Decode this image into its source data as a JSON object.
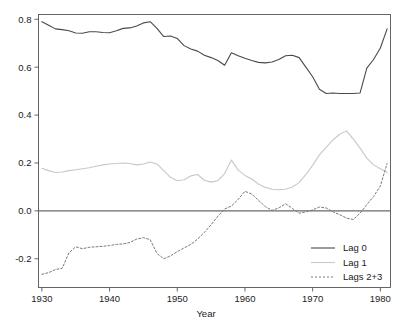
{
  "chart_data": {
    "type": "line",
    "title": "",
    "xlabel": "Year",
    "ylabel": "",
    "xlim": [
      1929.5,
      1981.5
    ],
    "ylim": [
      -0.32,
      0.82
    ],
    "grid": false,
    "legend_position": "bottom-right",
    "x_ticks": [
      1930,
      1940,
      1950,
      1960,
      1970,
      1980
    ],
    "x_tick_labels": [
      "1930",
      "1940",
      "1950",
      "1960",
      "1970",
      "1980"
    ],
    "y_ticks": [
      -0.2,
      0.0,
      0.2,
      0.4,
      0.6,
      0.8
    ],
    "y_tick_labels": [
      "-0.2",
      "0.0",
      "0.2",
      "0.4",
      "0.6",
      "0.8"
    ],
    "zero_reference_line": 0.0,
    "x": [
      1930,
      1931,
      1932,
      1933,
      1934,
      1935,
      1936,
      1937,
      1938,
      1939,
      1940,
      1941,
      1942,
      1943,
      1944,
      1945,
      1946,
      1947,
      1948,
      1949,
      1950,
      1951,
      1952,
      1953,
      1954,
      1955,
      1956,
      1957,
      1958,
      1959,
      1960,
      1961,
      1962,
      1963,
      1964,
      1965,
      1966,
      1967,
      1968,
      1969,
      1970,
      1971,
      1972,
      1973,
      1974,
      1975,
      1976,
      1977,
      1978,
      1979,
      1980,
      1981
    ],
    "series": [
      {
        "name": "Lag 0",
        "color": "#4a4a4a",
        "style": "solid",
        "values": [
          0.79,
          0.775,
          0.76,
          0.757,
          0.752,
          0.743,
          0.742,
          0.748,
          0.748,
          0.745,
          0.744,
          0.752,
          0.762,
          0.764,
          0.772,
          0.785,
          0.79,
          0.762,
          0.728,
          0.73,
          0.72,
          0.69,
          0.676,
          0.667,
          0.65,
          0.64,
          0.628,
          0.608,
          0.66,
          0.648,
          0.637,
          0.628,
          0.62,
          0.618,
          0.622,
          0.632,
          0.648,
          0.65,
          0.64,
          0.6,
          0.56,
          0.508,
          0.49,
          0.492,
          0.49,
          0.49,
          0.49,
          0.492,
          0.596,
          0.632,
          0.68,
          0.76
        ]
      },
      {
        "name": "Lag 1",
        "color": "#c8c8c8",
        "style": "solid",
        "values": [
          0.178,
          0.168,
          0.16,
          0.162,
          0.168,
          0.172,
          0.176,
          0.18,
          0.186,
          0.192,
          0.196,
          0.198,
          0.2,
          0.198,
          0.192,
          0.196,
          0.204,
          0.196,
          0.168,
          0.14,
          0.126,
          0.13,
          0.146,
          0.152,
          0.128,
          0.12,
          0.126,
          0.156,
          0.212,
          0.17,
          0.148,
          0.133,
          0.112,
          0.098,
          0.09,
          0.088,
          0.09,
          0.1,
          0.118,
          0.152,
          0.19,
          0.234,
          0.265,
          0.296,
          0.32,
          0.334,
          0.3,
          0.262,
          0.22,
          0.192,
          0.176,
          0.16
        ]
      },
      {
        "name": "Lags 2+3",
        "color": "#7a7a7a",
        "style": "dashed",
        "values": [
          -0.265,
          -0.258,
          -0.245,
          -0.24,
          -0.175,
          -0.15,
          -0.158,
          -0.152,
          -0.15,
          -0.148,
          -0.145,
          -0.14,
          -0.138,
          -0.132,
          -0.118,
          -0.112,
          -0.12,
          -0.178,
          -0.2,
          -0.188,
          -0.17,
          -0.155,
          -0.14,
          -0.118,
          -0.09,
          -0.058,
          -0.022,
          0.008,
          0.02,
          0.048,
          0.082,
          0.07,
          0.044,
          0.018,
          0.002,
          0.012,
          0.03,
          0.01,
          -0.01,
          -0.004,
          0.004,
          0.016,
          0.012,
          -0.004,
          -0.016,
          -0.03,
          -0.036,
          -0.01,
          0.026,
          0.06,
          0.104,
          0.198
        ]
      }
    ],
    "legend": [
      {
        "label": "Lag 0",
        "color": "#4a4a4a",
        "style": "solid"
      },
      {
        "label": "Lag 1",
        "color": "#c8c8c8",
        "style": "solid"
      },
      {
        "label": "Lags 2+3",
        "color": "#7a7a7a",
        "style": "dashed"
      }
    ]
  }
}
